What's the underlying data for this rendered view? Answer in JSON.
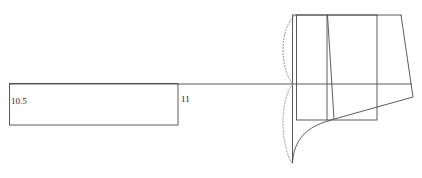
{
  "canvas": {
    "width": 422,
    "height": 178,
    "background": "#ffffff",
    "stroke_color": "#3c3c3c",
    "stroke_color_light": "#6e6e6e",
    "stroke_width": 0.9
  },
  "labels": [
    {
      "name": "dimension-label-10-5",
      "text": "10.5",
      "x": 11,
      "y": 104,
      "font_size": 9
    },
    {
      "name": "dimension-label-11",
      "text": "11",
      "x": 181,
      "y": 102,
      "font_size": 9
    }
  ],
  "geometry": {
    "centerline": {
      "name": "horizontal-centerline",
      "x1": 9,
      "y1": 84,
      "x2": 412,
      "y2": 84
    },
    "left_rectangle": {
      "name": "left-rectangle",
      "x": 9,
      "y": 83,
      "width": 169,
      "height": 42
    },
    "right_rectangle": {
      "name": "right-rectangle",
      "x": 296,
      "y": 15,
      "width": 81,
      "height": 105
    },
    "outer_top_edge": {
      "name": "outer-top-edge",
      "x1": 292,
      "y1": 15,
      "x2": 401,
      "y2": 15
    },
    "long_vertical": {
      "name": "long-vertical-axis-line",
      "x1": 292,
      "y1": 15,
      "x2": 292,
      "y2": 163
    },
    "inner_vertical": {
      "name": "inner-vertical-line",
      "x1": 327,
      "y1": 15,
      "x2": 327,
      "y2": 120
    },
    "inner_slant": {
      "name": "inner-slanted-line",
      "x1": 327,
      "y1": 15,
      "x2": 334,
      "y2": 119
    },
    "outer_slant": {
      "name": "outer-slanted-line",
      "x1": 401,
      "y1": 15,
      "x2": 413,
      "y2": 97
    },
    "bottom_slant": {
      "name": "bottom-slanted-line",
      "x1": 330,
      "y1": 120,
      "x2": 413,
      "y2": 97
    },
    "fillet_curve": {
      "name": "fillet-curve",
      "d": "M 292 163 C 293 140 305 126 330 120"
    },
    "upper_dotted_arc": {
      "name": "upper-dotted-arc",
      "d": "M 296 15 C 279 26 279 68 293 84",
      "dash": "1.2 1.8"
    },
    "lower_dotted_arc": {
      "name": "lower-dotted-arc",
      "d": "M 293 84 C 279 100 280 146 292 164",
      "dash": "1.2 1.8"
    }
  }
}
